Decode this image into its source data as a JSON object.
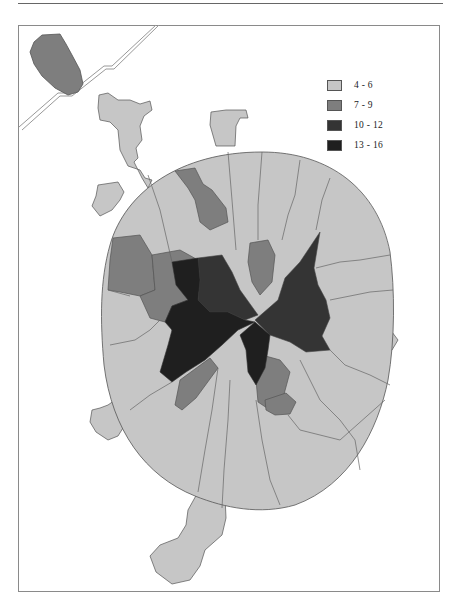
{
  "map": {
    "inset_present": true,
    "colors": {
      "class1": "#c6c6c6",
      "class2": "#7e7e7e",
      "class3": "#343434",
      "class4": "#1f1f1f",
      "border": "#555555"
    }
  },
  "legend": {
    "items": [
      {
        "label": "4 - 6",
        "color": "#c6c6c6"
      },
      {
        "label": "7 - 9",
        "color": "#7e7e7e"
      },
      {
        "label": "10 - 12",
        "color": "#343434"
      },
      {
        "label": "13 - 16",
        "color": "#1f1f1f"
      }
    ]
  }
}
